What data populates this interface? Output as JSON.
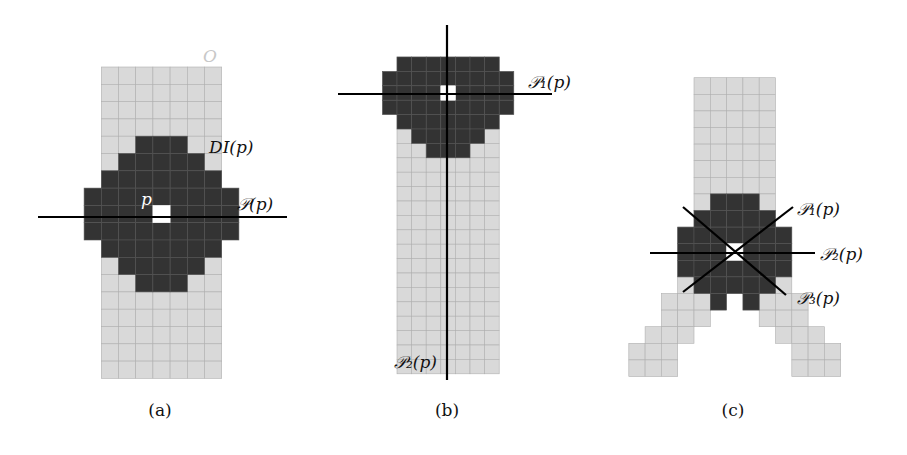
{
  "colors": {
    "object": "#d9d9d9",
    "object_grid": "#b0b0b0",
    "disk": "#333333",
    "disk_grid": "#555555",
    "center": "#ffffff",
    "line": "#000000",
    "object_label": "#c8c8c8"
  },
  "panels": [
    {
      "id": "a",
      "caption": "(a)",
      "caption_pos": [
        160,
        416
      ],
      "grid": {
        "x0": 101.3,
        "y0": 67,
        "cw": 17.2,
        "ch": 17.3
      },
      "object_rows": [
        {
          "r": 0,
          "c": [
            0,
            6
          ]
        },
        {
          "r": 1,
          "c": [
            0,
            6
          ]
        },
        {
          "r": 2,
          "c": [
            0,
            6
          ]
        },
        {
          "r": 3,
          "c": [
            0,
            6
          ]
        },
        {
          "r": 4,
          "c": [
            0,
            6
          ]
        },
        {
          "r": 5,
          "c": [
            0,
            6
          ]
        },
        {
          "r": 6,
          "c": [
            0,
            6
          ]
        },
        {
          "r": 7,
          "c": [
            0,
            6
          ]
        },
        {
          "r": 8,
          "c": [
            0,
            6
          ]
        },
        {
          "r": 9,
          "c": [
            0,
            6
          ]
        },
        {
          "r": 10,
          "c": [
            0,
            6
          ]
        },
        {
          "r": 11,
          "c": [
            0,
            6
          ]
        },
        {
          "r": 12,
          "c": [
            0,
            6
          ]
        },
        {
          "r": 13,
          "c": [
            0,
            6
          ]
        },
        {
          "r": 14,
          "c": [
            0,
            6
          ]
        },
        {
          "r": 15,
          "c": [
            0,
            6
          ]
        },
        {
          "r": 16,
          "c": [
            0,
            6
          ]
        },
        {
          "r": 17,
          "c": [
            0,
            6
          ]
        }
      ],
      "disk_rows": [
        {
          "r": 4,
          "c": [
            2,
            4
          ]
        },
        {
          "r": 5,
          "c": [
            1,
            5
          ]
        },
        {
          "r": 6,
          "c": [
            0,
            6
          ]
        },
        {
          "r": 7,
          "c": [
            -1,
            7
          ]
        },
        {
          "r": 8,
          "c": [
            -1,
            7
          ]
        },
        {
          "r": 9,
          "c": [
            -1,
            7
          ]
        },
        {
          "r": 10,
          "c": [
            0,
            6
          ]
        },
        {
          "r": 11,
          "c": [
            1,
            5
          ]
        },
        {
          "r": 12,
          "c": [
            2,
            4
          ]
        }
      ],
      "center_cell": {
        "r": 8,
        "c": 3
      },
      "lines": [
        {
          "name": "line-P",
          "x1": 38,
          "y1": 217,
          "x2": 287,
          "y2": 217
        }
      ],
      "labels": [
        {
          "name": "object-label-O",
          "text": "O",
          "x": 203,
          "y": 62,
          "color": "#c8c8c8",
          "size": 19
        },
        {
          "name": "label-DI-p",
          "text": "DI(p)",
          "x": 209,
          "y": 153,
          "color": "#111111",
          "size": 16
        },
        {
          "name": "label-p",
          "text": "p",
          "x": 141,
          "y": 205,
          "color": "#ffffff",
          "size": 17
        },
        {
          "name": "label-P-p",
          "text": "𝒫(p)",
          "x": 237,
          "y": 210,
          "color": "#111111",
          "size": 16
        }
      ]
    },
    {
      "id": "b",
      "caption": "(b)",
      "caption_pos": [
        447,
        416
      ],
      "grid": {
        "x0": 397,
        "y0": 57,
        "cw": 14.6,
        "ch": 14.4
      },
      "object_rows": [
        {
          "r": 0,
          "c": [
            0,
            6
          ]
        },
        {
          "r": 1,
          "c": [
            0,
            6
          ]
        },
        {
          "r": 2,
          "c": [
            0,
            6
          ]
        },
        {
          "r": 3,
          "c": [
            0,
            6
          ]
        },
        {
          "r": 4,
          "c": [
            0,
            6
          ]
        },
        {
          "r": 5,
          "c": [
            0,
            6
          ]
        },
        {
          "r": 6,
          "c": [
            0,
            6
          ]
        },
        {
          "r": 7,
          "c": [
            0,
            6
          ]
        },
        {
          "r": 8,
          "c": [
            0,
            6
          ]
        },
        {
          "r": 9,
          "c": [
            0,
            6
          ]
        },
        {
          "r": 10,
          "c": [
            0,
            6
          ]
        },
        {
          "r": 11,
          "c": [
            0,
            6
          ]
        },
        {
          "r": 12,
          "c": [
            0,
            6
          ]
        },
        {
          "r": 13,
          "c": [
            0,
            6
          ]
        },
        {
          "r": 14,
          "c": [
            0,
            6
          ]
        },
        {
          "r": 15,
          "c": [
            0,
            6
          ]
        },
        {
          "r": 16,
          "c": [
            0,
            6
          ]
        },
        {
          "r": 17,
          "c": [
            0,
            6
          ]
        },
        {
          "r": 18,
          "c": [
            0,
            6
          ]
        },
        {
          "r": 19,
          "c": [
            0,
            6
          ]
        },
        {
          "r": 20,
          "c": [
            0,
            6
          ]
        },
        {
          "r": 21,
          "c": [
            0,
            6
          ]
        }
      ],
      "disk_rows": [
        {
          "r": 0,
          "c": [
            0,
            6
          ]
        },
        {
          "r": 1,
          "c": [
            -1,
            7
          ]
        },
        {
          "r": 2,
          "c": [
            -1,
            7
          ]
        },
        {
          "r": 3,
          "c": [
            -1,
            7
          ]
        },
        {
          "r": 4,
          "c": [
            0,
            6
          ]
        },
        {
          "r": 5,
          "c": [
            1,
            5
          ]
        },
        {
          "r": 6,
          "c": [
            2,
            4
          ]
        }
      ],
      "center_cell": {
        "r": 2,
        "c": 3
      },
      "lines": [
        {
          "name": "line-P1",
          "x1": 338,
          "y1": 94,
          "x2": 552,
          "y2": 94
        },
        {
          "name": "line-P2",
          "x1": 447,
          "y1": 25,
          "x2": 447,
          "y2": 380
        }
      ],
      "labels": [
        {
          "name": "label-P1-p",
          "text": "𝒫₁(p)",
          "x": 528,
          "y": 88,
          "color": "#111111",
          "size": 16
        },
        {
          "name": "label-P2-p",
          "text": "𝒫₂(p)",
          "x": 394,
          "y": 368,
          "color": "#111111",
          "size": 16
        }
      ]
    },
    {
      "id": "c",
      "caption": "(c)",
      "caption_pos": [
        733,
        416
      ],
      "grid": {
        "x0": 694,
        "y0": 77.7,
        "cw": 16.3,
        "ch": 16.6
      },
      "object_rows": [
        {
          "r": 0,
          "c": [
            0,
            4
          ]
        },
        {
          "r": 1,
          "c": [
            0,
            4
          ]
        },
        {
          "r": 2,
          "c": [
            0,
            4
          ]
        },
        {
          "r": 3,
          "c": [
            0,
            4
          ]
        },
        {
          "r": 4,
          "c": [
            0,
            4
          ]
        },
        {
          "r": 5,
          "c": [
            0,
            4
          ]
        },
        {
          "r": 6,
          "c": [
            0,
            4
          ]
        },
        {
          "r": 7,
          "c": [
            0,
            4
          ]
        },
        {
          "r": 8,
          "c": [
            0,
            4
          ]
        },
        {
          "r": 9,
          "c": [
            -1,
            5
          ]
        },
        {
          "r": 10,
          "c": [
            -1,
            5
          ]
        },
        {
          "r": 11,
          "c": [
            -1,
            5
          ]
        },
        {
          "r": 12,
          "c": [
            -1,
            5
          ]
        },
        {
          "r": 13,
          "c": [
            -2,
            0
          ]
        },
        {
          "r": 13,
          "c": [
            4,
            6
          ]
        },
        {
          "r": 14,
          "c": [
            -2,
            0
          ]
        },
        {
          "r": 14,
          "c": [
            4,
            6
          ]
        },
        {
          "r": 15,
          "c": [
            -3,
            -1
          ]
        },
        {
          "r": 15,
          "c": [
            5,
            7
          ]
        },
        {
          "r": 16,
          "c": [
            -4,
            -2
          ]
        },
        {
          "r": 16,
          "c": [
            6,
            8
          ]
        },
        {
          "r": 17,
          "c": [
            -4,
            -2
          ]
        },
        {
          "r": 17,
          "c": [
            6,
            8
          ]
        }
      ],
      "disk_rows": [
        {
          "r": 7,
          "c": [
            1,
            3
          ]
        },
        {
          "r": 8,
          "c": [
            0,
            4
          ]
        },
        {
          "r": 9,
          "c": [
            -1,
            5
          ]
        },
        {
          "r": 10,
          "c": [
            -1,
            5
          ]
        },
        {
          "r": 11,
          "c": [
            -1,
            5
          ]
        },
        {
          "r": 12,
          "c": [
            0,
            4
          ]
        },
        {
          "r": 13,
          "c": [
            1,
            1
          ]
        },
        {
          "r": 13,
          "c": [
            3,
            3
          ]
        }
      ],
      "center_cell": {
        "r": 10,
        "c": 2
      },
      "lines": [
        {
          "name": "line-P1",
          "x1": 683,
          "y1": 292,
          "x2": 793,
          "y2": 207
        },
        {
          "name": "line-P2",
          "x1": 650,
          "y1": 253,
          "x2": 815,
          "y2": 253
        },
        {
          "name": "line-P3",
          "x1": 683,
          "y1": 207,
          "x2": 786,
          "y2": 295
        }
      ],
      "labels": [
        {
          "name": "label-P1-p",
          "text": "𝒫₁(p)",
          "x": 797,
          "y": 215,
          "color": "#111111",
          "size": 17
        },
        {
          "name": "label-P2-p",
          "text": "𝒫₂(p)",
          "x": 820,
          "y": 260,
          "color": "#111111",
          "size": 17
        },
        {
          "name": "label-P3-p",
          "text": "𝒫₃(p)",
          "x": 797,
          "y": 304,
          "color": "#111111",
          "size": 17
        }
      ]
    }
  ]
}
